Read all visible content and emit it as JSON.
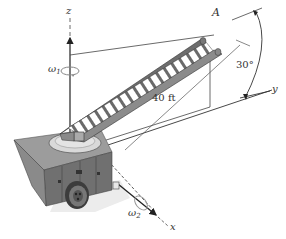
{
  "figure": {
    "axes": {
      "x_label": "x",
      "y_label": "y",
      "z_label": "z"
    },
    "point_label": "A",
    "dimensions": {
      "length_label": "40 ft",
      "angle_label": "30°"
    },
    "angular_velocities": {
      "omega1_symbol": "ω",
      "omega1_sub": "1",
      "omega2_symbol": "ω",
      "omega2_sub": "2"
    },
    "colors": {
      "line": "#3a3a3a",
      "ladder_dark": "#5a5a5a",
      "ladder_mid": "#8a8a8a",
      "ladder_light": "#c8c8c8",
      "truck_top": "#9a9a9a",
      "truck_side": "#6e6e6e",
      "turntable": "#d6d6d6",
      "shadow": "#e6e6e6"
    }
  }
}
